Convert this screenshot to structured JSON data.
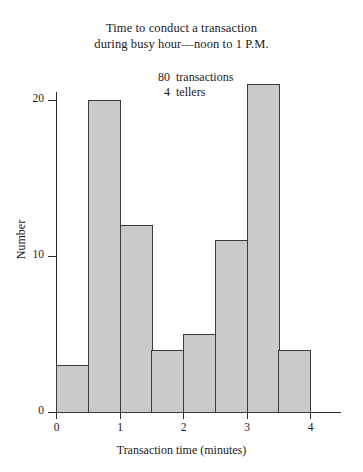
{
  "figure": {
    "title_lines": [
      "Time to conduct a transaction",
      "during busy hour—noon to 1 P.M."
    ],
    "annotations": [
      {
        "value": "80",
        "label": "transactions"
      },
      {
        "value": "4",
        "label": "tellers"
      }
    ]
  },
  "chart_data": {
    "type": "bar",
    "title": "Time to conduct a transaction during busy hour—noon to 1 P.M.",
    "subtitle": "80 transactions, 4 tellers",
    "xlabel": "Transaction time (minutes)",
    "ylabel": "Number",
    "bin_width": 0.5,
    "bin_edges": [
      0,
      0.5,
      1.0,
      1.5,
      2.0,
      2.5,
      3.0,
      3.5,
      4.0
    ],
    "categories": [
      "0–0.5",
      "0.5–1",
      "1–1.5",
      "1.5–2",
      "2–2.5",
      "2.5–3",
      "3–3.5",
      "3.5–4"
    ],
    "values": [
      3,
      20,
      12,
      4,
      5,
      11,
      21,
      4
    ],
    "total": 80,
    "xlim": [
      0,
      4
    ],
    "ylim": [
      0,
      21
    ],
    "x_ticks": [
      "0",
      "1",
      "2",
      "3",
      "4"
    ],
    "x_tick_values": [
      0,
      1,
      2,
      3,
      4
    ],
    "y_ticks": [
      "0",
      "10",
      "20"
    ],
    "y_tick_values": [
      0,
      10,
      20
    ],
    "grid": false,
    "legend": "none",
    "bar_fill_color": "#cacaca",
    "bar_edge_color": "#3a3a3a",
    "axis_color": "#2a2a2a"
  }
}
